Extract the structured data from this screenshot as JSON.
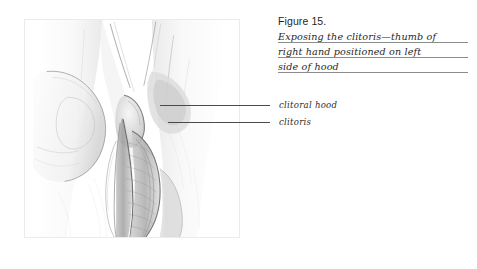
{
  "page": {
    "background_color": "#ffffff",
    "width": 477,
    "height": 269
  },
  "caption": {
    "figure_number": "Figure 15.",
    "lines": [
      "Exposing the clitoris—thumb of",
      "right hand positioned on left",
      "side of hood"
    ],
    "full_text": "Exposing the clitoris—thumb of right hand positioned on left side of hood",
    "underline_color": "#8c8c8c",
    "text_color": "#1f1f1f"
  },
  "callouts": [
    {
      "label": "clitoral hood",
      "leader_line": true
    },
    {
      "label": "clitoris",
      "leader_line": true
    }
  ],
  "illustration": {
    "title": "pencil-anatomical-drawing",
    "description": "Graphite pencil study of a right hand thumb pressing on the left side of the clitoral hood, exposing the clitoris",
    "frame_color": "#ebebeb",
    "line_color": "#4a4a4a",
    "shading_color": "#8a8a8a"
  }
}
